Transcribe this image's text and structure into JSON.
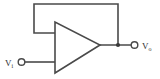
{
  "diagram": {
    "type": "circuit-schematic",
    "background_color": "#ffffff",
    "line_color": "#4a4a4a",
    "text_color": "#2e2e2e",
    "components": {
      "amplifier": {
        "name": "operational-amplifier",
        "shape": "triangle",
        "inverting_input": "top",
        "noninverting_input": "bottom",
        "output": "apex-right"
      },
      "feedback": {
        "name": "feedback-wire",
        "description": "output routed back to inverting input"
      }
    },
    "labels": {
      "input": {
        "symbol": "V",
        "subscript": "i"
      },
      "output": {
        "symbol": "V",
        "subscript": "o"
      }
    },
    "terminals": {
      "input_terminal": "open-circle",
      "output_terminal": "open-circle",
      "junction": "filled-dot"
    }
  }
}
